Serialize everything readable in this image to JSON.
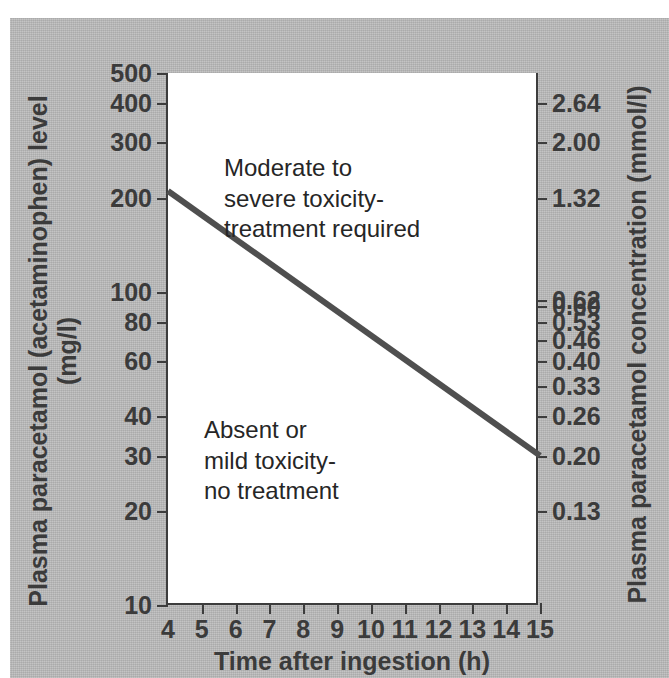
{
  "figure": {
    "background_color": "#b6b6b6",
    "plot_background_color": "#ffffff",
    "axis_color": "#3d3d3d",
    "line_color": "#4f4f4f"
  },
  "chart_data": {
    "type": "line",
    "title": "",
    "subtitle": "",
    "xlabel": "Time after ingestion (h)",
    "ylabel": "Plasma paracetamol (acetaminophen) level (mg/l)",
    "ylabel_right": "Plasma paracetamol concentration (mmol/l)",
    "yscale": "log",
    "xscale": "linear",
    "xlim": [
      4,
      15
    ],
    "ylim": [
      10,
      500
    ],
    "grid": false,
    "legend": "none",
    "xticks": [
      4,
      5,
      6,
      7,
      8,
      9,
      10,
      11,
      12,
      13,
      14,
      15
    ],
    "xticklabels": [
      "4",
      "5",
      "6",
      "7",
      "8",
      "9",
      "10",
      "11",
      "12",
      "13",
      "14",
      "15"
    ],
    "yticks": [
      500,
      400,
      300,
      200,
      100,
      80,
      60,
      40,
      30,
      20,
      10
    ],
    "yticklabels": [
      "500",
      "400",
      "300",
      "200",
      "100",
      "80",
      "60",
      "40",
      "30",
      "20",
      "10"
    ],
    "yticks_right_values": [
      400,
      300,
      200,
      94,
      90,
      80,
      70,
      60,
      50,
      40,
      30,
      20
    ],
    "yticklabels_right": [
      "2.64",
      "2.00",
      "1.32",
      "0.62",
      "0.60",
      "0.53",
      "0.46",
      "0.40",
      "0.33",
      "0.26",
      "0.20",
      "0.13"
    ],
    "series": [
      {
        "name": "Treatment line (nomogram)",
        "x": [
          4,
          15
        ],
        "values": [
          210,
          30
        ],
        "style": "solid",
        "color": "#4f4f4f"
      }
    ],
    "annotations": [
      {
        "name": "upper-region-label",
        "text": "Moderate to\nsevere toxicity-\ntreatment required",
        "x": 6.6,
        "y": 280
      },
      {
        "name": "lower-region-label",
        "text": "Absent or\nmild toxicity-\nno treatment",
        "x": 6.0,
        "y": 34
      }
    ]
  },
  "axes": {
    "left": {
      "title": "Plasma paracetamol (acetaminophen) level (mg/l)",
      "ticks": [
        {
          "label": "500",
          "value": 500
        },
        {
          "label": "400",
          "value": 400
        },
        {
          "label": "300",
          "value": 300
        },
        {
          "label": "200",
          "value": 200
        },
        {
          "label": "100",
          "value": 100
        },
        {
          "label": "80",
          "value": 80
        },
        {
          "label": "60",
          "value": 60
        },
        {
          "label": "40",
          "value": 40
        },
        {
          "label": "30",
          "value": 30
        },
        {
          "label": "20",
          "value": 20
        },
        {
          "label": "10",
          "value": 10
        }
      ]
    },
    "right": {
      "title": "Plasma paracetamol concentration (mmol/l)",
      "ticks": [
        {
          "label": "2.64",
          "value": 400
        },
        {
          "label": "2.00",
          "value": 300
        },
        {
          "label": "1.32",
          "value": 200
        },
        {
          "label": "0.62",
          "value": 94
        },
        {
          "label": "0.60",
          "value": 90
        },
        {
          "label": "0.53",
          "value": 80
        },
        {
          "label": "0.46",
          "value": 70
        },
        {
          "label": "0.40",
          "value": 60
        },
        {
          "label": "0.33",
          "value": 50
        },
        {
          "label": "0.26",
          "value": 40
        },
        {
          "label": "0.20",
          "value": 30
        },
        {
          "label": "0.13",
          "value": 20
        }
      ]
    },
    "bottom": {
      "title": "Time after ingestion (h)",
      "ticks": [
        {
          "label": "4",
          "value": 4
        },
        {
          "label": "5",
          "value": 5
        },
        {
          "label": "6",
          "value": 6
        },
        {
          "label": "7",
          "value": 7
        },
        {
          "label": "8",
          "value": 8
        },
        {
          "label": "9",
          "value": 9
        },
        {
          "label": "10",
          "value": 10
        },
        {
          "label": "11",
          "value": 11
        },
        {
          "label": "12",
          "value": 12
        },
        {
          "label": "13",
          "value": 13
        },
        {
          "label": "14",
          "value": 14
        },
        {
          "label": "15",
          "value": 15
        }
      ]
    }
  },
  "annotations": {
    "upper": "Moderate to\nsevere toxicity-\ntreatment required",
    "lower": "Absent or\nmild toxicity-\nno treatment"
  }
}
